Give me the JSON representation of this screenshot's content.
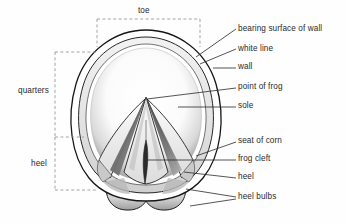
{
  "figure": {
    "type": "labeled-line-drawing",
    "background_color": "#fefefe",
    "ink_color": "#1a1a1a",
    "bracket_color": "#9a9a9a",
    "leader_color": "#2a2a2a",
    "text_color": "#2a2a2a"
  },
  "right_labels": [
    {
      "id": "bearing-surface-of-wall",
      "text": "bearing surface of wall",
      "x": 238,
      "y": 31,
      "leader": {
        "from_x": 236,
        "from_y": 29,
        "to_x": 196,
        "to_y": 57
      }
    },
    {
      "id": "white-line",
      "text": "white line",
      "x": 238,
      "y": 51,
      "leader": {
        "from_x": 236,
        "from_y": 49,
        "to_x": 200,
        "to_y": 63
      }
    },
    {
      "id": "wall",
      "text": "wall",
      "x": 238,
      "y": 69,
      "leader": {
        "from_x": 236,
        "from_y": 68,
        "to_x": 214,
        "to_y": 68
      }
    },
    {
      "id": "point-of-frog",
      "text": "point of frog",
      "x": 238,
      "y": 89,
      "leader": {
        "from_x": 236,
        "from_y": 88,
        "to_x": 146,
        "to_y": 99
      }
    },
    {
      "id": "sole",
      "text": "sole",
      "x": 238,
      "y": 108,
      "leader": {
        "from_x": 236,
        "from_y": 107,
        "to_x": 178,
        "to_y": 107
      }
    },
    {
      "id": "seat-of-corn",
      "text": "seat of corn",
      "x": 238,
      "y": 143,
      "leader": {
        "from_x": 236,
        "from_y": 142,
        "to_x": 196,
        "to_y": 155
      }
    },
    {
      "id": "frog-cleft",
      "text": "frog cleft",
      "x": 238,
      "y": 161,
      "leader": {
        "from_x": 236,
        "from_y": 160,
        "to_x": 146,
        "to_y": 160
      }
    },
    {
      "id": "heel",
      "text": "heel",
      "x": 238,
      "y": 179,
      "leader": {
        "from_x": 236,
        "from_y": 178,
        "to_x": 184,
        "to_y": 173
      }
    },
    {
      "id": "heel-bulbs",
      "text": "heel bulbs",
      "x": 238,
      "y": 199,
      "leader": {
        "from_x": 236,
        "from_y": 198,
        "to_x": 186,
        "to_y": 190
      }
    },
    {
      "id": "heel-bulbs-second",
      "text": "",
      "x": 0,
      "y": 0,
      "leader": {
        "from_x": 236,
        "from_y": 199,
        "to_x": 190,
        "to_y": 204
      }
    }
  ],
  "brackets": [
    {
      "id": "toe",
      "text": "toe",
      "orientation": "horizontal-top",
      "label_x": 145,
      "label_y": 12,
      "x1": 97,
      "x2": 200,
      "y_top": 19,
      "y_bottom": 47
    },
    {
      "id": "quarters",
      "text": "quarters",
      "orientation": "vertical-left",
      "label_x": 18,
      "label_y": 92,
      "x_left": 55,
      "x_right": 97,
      "y1": 52,
      "y2": 137
    },
    {
      "id": "heel",
      "text": "heel",
      "orientation": "vertical-left",
      "label_x": 31,
      "label_y": 165,
      "x_left": 55,
      "x_right": 97,
      "y1": 137,
      "y2": 190
    }
  ],
  "drawing_parts": [
    {
      "name": "outer-wall-outline",
      "description": "outer hoof wall border, ovoid"
    },
    {
      "name": "bearing-surface-band",
      "description": "ring between outer wall and white line"
    },
    {
      "name": "white-line",
      "description": "fine inner boundary line of the wall"
    },
    {
      "name": "sole",
      "description": "concave pale region inside the white line"
    },
    {
      "name": "frog",
      "description": "central arrowhead wedge of elastic horn"
    },
    {
      "name": "frog-cleft",
      "description": "central groove of the frog"
    },
    {
      "name": "collateral-sulci",
      "description": "dark grooves each side of the frog"
    },
    {
      "name": "bars",
      "description": "angled ridges running from heel toward point of frog"
    },
    {
      "name": "seat-of-corn",
      "description": "angle between wall and bar at the heel"
    },
    {
      "name": "heel-bulbs",
      "description": "two rounded lobes at the rear of the hoof"
    }
  ]
}
